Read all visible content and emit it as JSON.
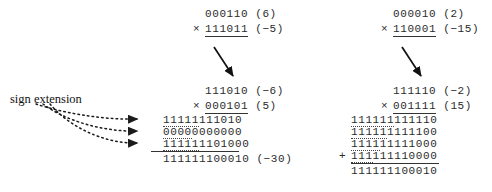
{
  "figure": {
    "label_sign_extension": "sign extension",
    "left_block": {
      "top": {
        "multiplicand": "000110",
        "multiplicand_value": "(6)",
        "operator": "×",
        "multiplier": "111011",
        "multiplier_value": "(−5)"
      },
      "bottom": {
        "multiplicand": "111010",
        "multiplicand_value": "(−6)",
        "operator": "×",
        "multiplier": "000101",
        "multiplier_value": "(5)",
        "partials": [
          {
            "ext": "11111",
            "body": "111010",
            "operator": ""
          },
          {
            "ext": "0000",
            "body": "0000000",
            "operator": ""
          },
          {
            "ext": "11111",
            "body": "1101000",
            "operator": ""
          }
        ],
        "sum": "111111100010",
        "sum_value": "(−30)"
      }
    },
    "right_block": {
      "top": {
        "multiplicand": "000010",
        "multiplicand_value": "(2)",
        "operator": "×",
        "multiplier": "110001",
        "multiplier_value": "(−15)"
      },
      "bottom": {
        "multiplicand": "111110",
        "multiplicand_value": "(−2)",
        "operator": "×",
        "multiplier": "001111",
        "multiplier_value": "(15)",
        "partials": [
          {
            "ext": "111111",
            "body": "111110",
            "operator": ""
          },
          {
            "ext": "11111",
            "body": "1111100",
            "operator": ""
          },
          {
            "ext": "1111",
            "body": "11111000",
            "operator": ""
          },
          {
            "ext": "111",
            "body": "111110000",
            "operator": "+"
          }
        ],
        "sum": "111111100010",
        "sum_value": "(−30)"
      }
    },
    "colors": {
      "text": "#2b2b2b",
      "rule": "#333333",
      "arrow": "#111111",
      "dotted_arrow": "#222222"
    }
  }
}
